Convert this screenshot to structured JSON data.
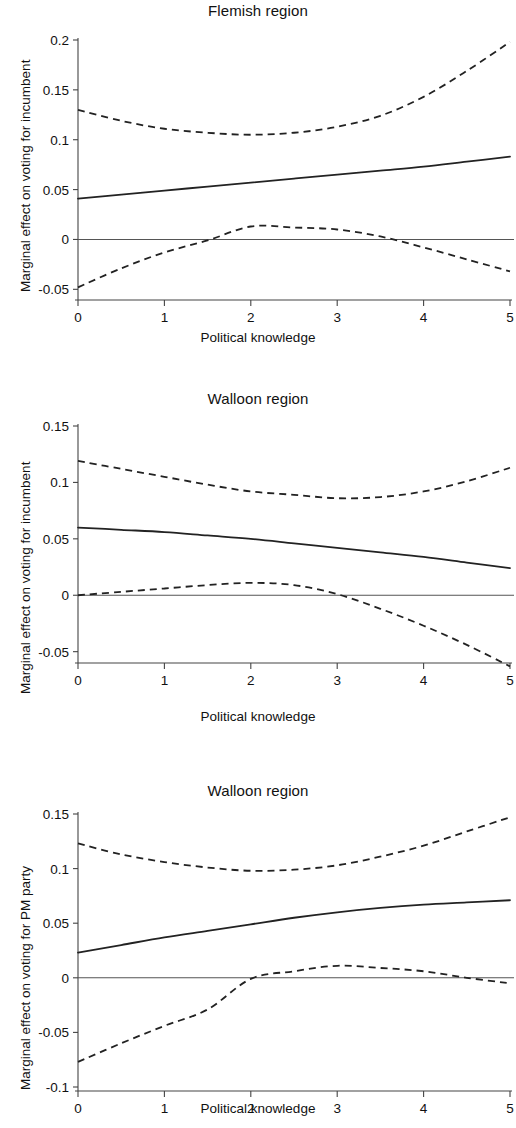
{
  "figure": {
    "background": "#ffffff",
    "line_color": "#222222",
    "axis_color": "#444444"
  },
  "panels": [
    {
      "title": "Flemish region",
      "ylabel": "Marginal effect on voting for incumbent",
      "xlabel": "Political knowledge",
      "ytick_labels": [
        "0.2",
        "0.15",
        "0.1",
        "0.05",
        "0",
        "-0.05"
      ],
      "xtick_labels": [
        "0",
        "1",
        "2",
        "3",
        "4",
        "5"
      ]
    },
    {
      "title": "Walloon region",
      "ylabel": "Marginal effect on voting for incumbent",
      "xlabel": "Political knowledge",
      "ytick_labels": [
        "0.15",
        "0.1",
        "0.05",
        "0",
        "-0.05"
      ],
      "xtick_labels": [
        "0",
        "1",
        "2",
        "3",
        "4",
        "5"
      ]
    },
    {
      "title": "Walloon region",
      "ylabel": "Marginal effect on voting for PM party",
      "xlabel": "Political knowledge",
      "ytick_labels": [
        "0.15",
        "0.1",
        "0.05",
        "0",
        "-0.05",
        "-0.1"
      ],
      "xtick_labels": [
        "0",
        "1",
        "2",
        "3",
        "4",
        "5"
      ]
    }
  ],
  "chart_data": [
    {
      "type": "line",
      "title": "Flemish region",
      "xlabel": "Political knowledge",
      "ylabel": "Marginal effect on voting for incumbent",
      "xlim": [
        0,
        5
      ],
      "ylim": [
        -0.065,
        0.205
      ],
      "yticks": [
        0.2,
        0.15,
        0.1,
        0.05,
        0,
        -0.05
      ],
      "xticks": [
        0,
        1,
        2,
        3,
        4,
        5
      ],
      "grid": false,
      "legend": "none",
      "reference_line_y": 0,
      "x": [
        0,
        0.5,
        1,
        1.5,
        2,
        2.5,
        3,
        3.5,
        4,
        4.5,
        5
      ],
      "series": [
        {
          "name": "Marginal effect (point estimate)",
          "style": "solid",
          "values": [
            0.041,
            0.045,
            0.049,
            0.053,
            0.057,
            0.061,
            0.065,
            0.069,
            0.073,
            0.078,
            0.083
          ]
        },
        {
          "name": "Upper 95% confidence bound",
          "style": "dashed",
          "values": [
            0.13,
            0.119,
            0.111,
            0.107,
            0.105,
            0.107,
            0.113,
            0.124,
            0.143,
            0.169,
            0.198
          ]
        },
        {
          "name": "Lower 95% confidence bound",
          "style": "dashed",
          "values": [
            -0.048,
            -0.029,
            -0.013,
            -0.001,
            0.013,
            0.012,
            0.01,
            0.003,
            -0.008,
            -0.02,
            -0.032
          ]
        }
      ]
    },
    {
      "type": "line",
      "title": "Walloon region",
      "xlabel": "Political knowledge",
      "ylabel": "Marginal effect on voting for incumbent",
      "xlim": [
        0,
        5
      ],
      "ylim": [
        -0.072,
        0.158
      ],
      "yticks": [
        0.15,
        0.1,
        0.05,
        0,
        -0.05
      ],
      "xticks": [
        0,
        1,
        2,
        3,
        4,
        5
      ],
      "grid": false,
      "legend": "none",
      "reference_line_y": 0,
      "x": [
        0,
        0.5,
        1,
        1.5,
        2,
        2.5,
        3,
        3.5,
        4,
        4.5,
        5
      ],
      "series": [
        {
          "name": "Marginal effect (point estimate)",
          "style": "solid",
          "values": [
            0.06,
            0.058,
            0.056,
            0.053,
            0.05,
            0.046,
            0.042,
            0.038,
            0.034,
            0.029,
            0.024
          ]
        },
        {
          "name": "Upper 95% confidence bound",
          "style": "dashed",
          "values": [
            0.119,
            0.112,
            0.105,
            0.098,
            0.092,
            0.089,
            0.086,
            0.087,
            0.092,
            0.101,
            0.113
          ]
        },
        {
          "name": "Lower 95% confidence bound",
          "style": "dashed",
          "values": [
            0.0,
            0.003,
            0.006,
            0.009,
            0.011,
            0.009,
            0.001,
            -0.012,
            -0.027,
            -0.044,
            -0.063
          ]
        }
      ]
    },
    {
      "type": "line",
      "title": "Walloon region",
      "xlabel": "Political knowledge",
      "ylabel": "Marginal effect on voting for PM party",
      "xlim": [
        0,
        5
      ],
      "ylim": [
        -0.105,
        0.155
      ],
      "yticks": [
        0.15,
        0.1,
        0.05,
        0,
        -0.05,
        -0.1
      ],
      "xticks": [
        0,
        1,
        2,
        3,
        4,
        5
      ],
      "grid": false,
      "legend": "none",
      "reference_line_y": 0,
      "x": [
        0,
        0.5,
        1,
        1.5,
        2,
        2.5,
        3,
        3.5,
        4,
        4.5,
        5
      ],
      "series": [
        {
          "name": "Marginal effect (point estimate)",
          "style": "solid",
          "values": [
            0.023,
            0.03,
            0.037,
            0.043,
            0.049,
            0.055,
            0.06,
            0.064,
            0.067,
            0.069,
            0.071
          ]
        },
        {
          "name": "Upper 95% confidence bound",
          "style": "dashed",
          "values": [
            0.123,
            0.113,
            0.106,
            0.101,
            0.098,
            0.099,
            0.103,
            0.111,
            0.121,
            0.134,
            0.147
          ]
        },
        {
          "name": "Lower 95% confidence bound",
          "style": "dashed",
          "values": [
            -0.077,
            -0.06,
            -0.044,
            -0.029,
            -0.001,
            0.006,
            0.011,
            0.009,
            0.006,
            0.0,
            -0.005
          ]
        }
      ]
    }
  ]
}
